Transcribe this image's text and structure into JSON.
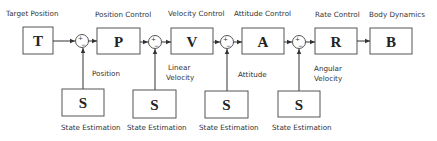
{
  "diagram": {
    "type": "cascaded-control-block-diagram",
    "blocks": [
      {
        "id": "T",
        "letter": "T",
        "title": "Target Position"
      },
      {
        "id": "P",
        "letter": "P",
        "title": "Position Control"
      },
      {
        "id": "V",
        "letter": "V",
        "title": "Velocity Control"
      },
      {
        "id": "A",
        "letter": "A",
        "title": "Attitude Control"
      },
      {
        "id": "R",
        "letter": "R",
        "title": "Rate Control"
      },
      {
        "id": "B",
        "letter": "B",
        "title": "Body Dynamics"
      }
    ],
    "summing_junctions": [
      {
        "plus": "+",
        "minus": "−",
        "feedback_label": [
          "Position"
        ]
      },
      {
        "plus": "+",
        "minus": "−",
        "feedback_label": [
          "Linear",
          "Velocity"
        ]
      },
      {
        "plus": "+",
        "minus": "−",
        "feedback_label": [
          "Attitude"
        ]
      },
      {
        "plus": "+",
        "minus": "−",
        "feedback_label": [
          "Angular",
          "Velocity"
        ]
      }
    ],
    "estimators": [
      {
        "letter": "S",
        "caption": "State Estimation"
      },
      {
        "letter": "S",
        "caption": "State Estimation"
      },
      {
        "letter": "S",
        "caption": "State Estimation"
      },
      {
        "letter": "S",
        "caption": "State Estimation"
      }
    ]
  }
}
